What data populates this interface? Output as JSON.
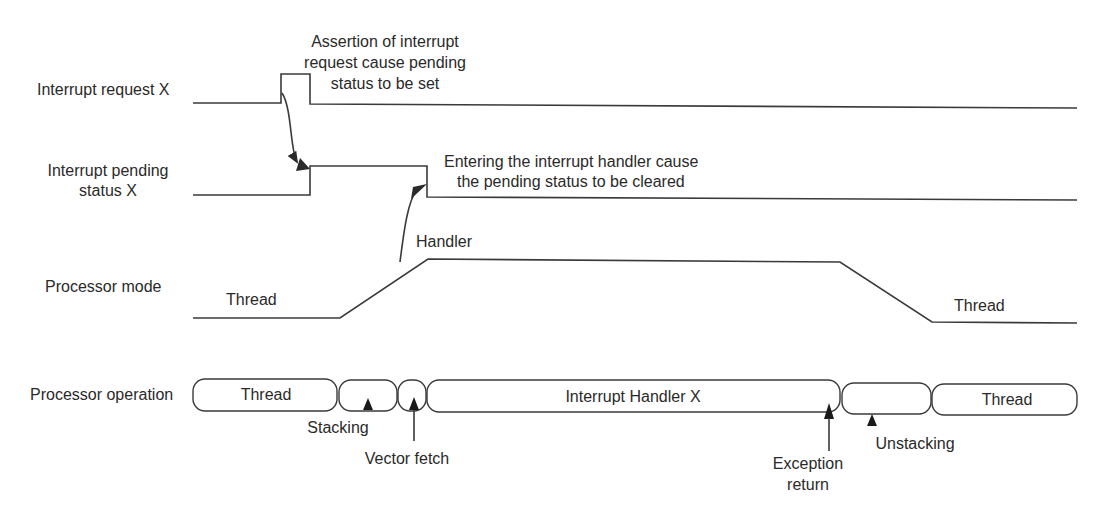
{
  "diagram": {
    "type": "timing-diagram",
    "signals": [
      {
        "id": "irq",
        "label": "Interrupt request X"
      },
      {
        "id": "pending",
        "label_line1": "Interrupt pending",
        "label_line2": "status X"
      },
      {
        "id": "mode",
        "label": "Processor mode",
        "states": [
          "Thread",
          "Handler",
          "Thread"
        ]
      },
      {
        "id": "operation",
        "label": "Processor operation"
      }
    ],
    "operation_segments": [
      {
        "label": "Thread"
      },
      {
        "label": ""
      },
      {
        "label": ""
      },
      {
        "label": "Interrupt Handler X"
      },
      {
        "label": ""
      },
      {
        "label": "Thread"
      }
    ],
    "annotations": {
      "assertion": [
        "Assertion of interrupt",
        "request cause pending",
        "status to be set"
      ],
      "entering": [
        "Entering the interrupt handler cause",
        "the pending status to be cleared"
      ],
      "stacking": "Stacking",
      "vector_fetch": "Vector fetch",
      "exception_return": [
        "Exception",
        "return"
      ],
      "unstacking": "Unstacking"
    },
    "colors": {
      "line": "#3a3a3a",
      "text": "#2a2a2a",
      "background": "#ffffff"
    }
  }
}
